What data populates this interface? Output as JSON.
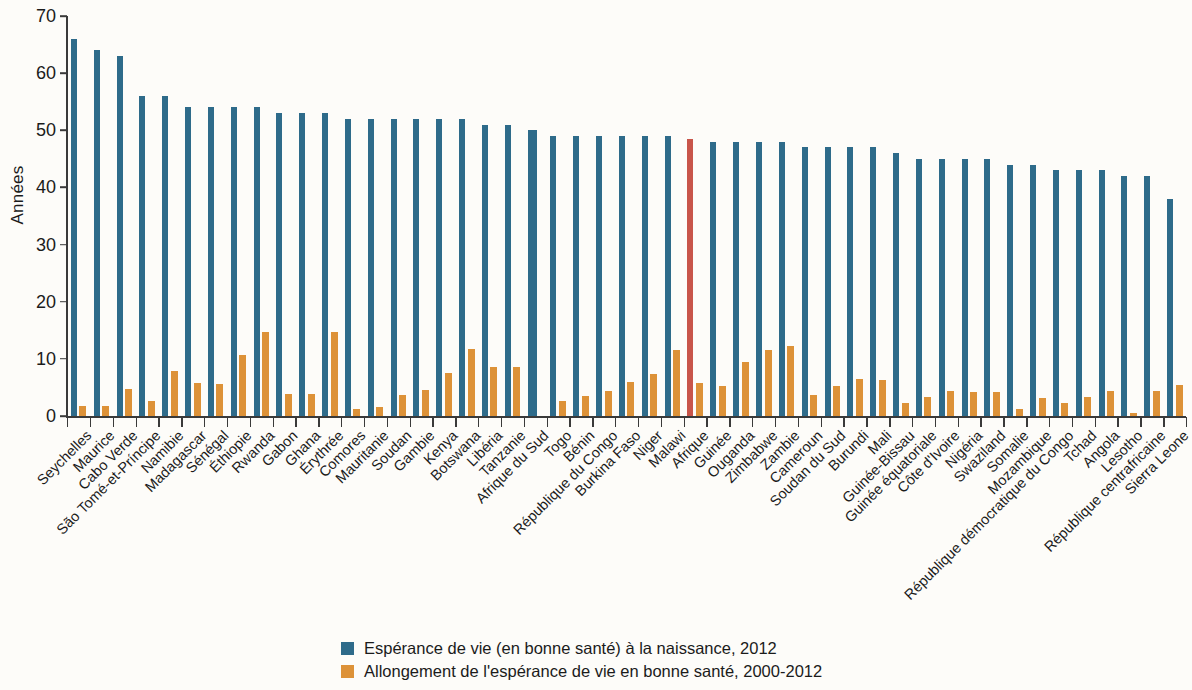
{
  "chart_data": {
    "type": "bar",
    "title": "",
    "subtitle": "",
    "xlabel": "",
    "ylabel": "Années",
    "ylim": [
      0,
      70
    ],
    "ytick_values": [
      0,
      10,
      20,
      30,
      40,
      50,
      60,
      70
    ],
    "ytick_labels": [
      "0",
      "10",
      "20",
      "30",
      "40",
      "50",
      "60",
      "70"
    ],
    "grid": false,
    "legend_position": "bottom-center",
    "highlight_category": "Afrique",
    "highlight_color": "#c8554a",
    "colors": {
      "series_1": "#2e6b8a",
      "series_2": "#dd9238",
      "highlight": "#c8554a",
      "axis": "#3a3a3a",
      "background": "#fdfcf9"
    },
    "categories": [
      "Seychelles",
      "Maurice",
      "Cabo Verde",
      "São Tomé-et-Príncipe",
      "Namibie",
      "Madagascar",
      "Sénégal",
      "Éthiopie",
      "Rwanda",
      "Gabon",
      "Ghana",
      "Érythrée",
      "Comores",
      "Mauritanie",
      "Soudan",
      "Gambie",
      "Kenya",
      "Botswana",
      "Libéria",
      "Tanzanie",
      "Afrique du Sud",
      "Togo",
      "Bénin",
      "République du Congo",
      "Burkina Faso",
      "Niger",
      "Malawi",
      "Afrique",
      "Guinée",
      "Ouganda",
      "Zimbabwe",
      "Zambie",
      "Cameroun",
      "Soudan du Sud",
      "Burundi",
      "Mali",
      "Guinée-Bissau",
      "Guinée équatoriale",
      "Côte d'Ivoire",
      "Nigéria",
      "Swaziland",
      "Somalie",
      "Mozambique",
      "République démocratique du Congo",
      "Tchad",
      "Angola",
      "Lesotho",
      "République centrafricaine",
      "Sierra Leone"
    ],
    "series": [
      {
        "name": "Espérance de vie (en bonne santé) à la naissance, 2012",
        "color": "#2e6b8a",
        "values": [
          66,
          64,
          63,
          56,
          56,
          54,
          54,
          54,
          54,
          53,
          53,
          53,
          52,
          52,
          52,
          52,
          52,
          52,
          51,
          51,
          50,
          49,
          49,
          49,
          49,
          49,
          49,
          48.5,
          48,
          48,
          48,
          48,
          47,
          47,
          47,
          47,
          46,
          45,
          45,
          45,
          45,
          44,
          44,
          43,
          43,
          43,
          42,
          42,
          38
        ]
      },
      {
        "name": "Allongement de l'espérance de vie en bonne santé, 2000-2012",
        "color": "#dd9238",
        "values": [
          1.8,
          1.7,
          4.8,
          2.6,
          7.9,
          5.8,
          5.6,
          10.7,
          14.7,
          3.9,
          3.8,
          14.7,
          1.3,
          1.6,
          3.7,
          4.6,
          7.6,
          11.7,
          8.6,
          8.5,
          0.0,
          2.6,
          3.5,
          4.4,
          6.0,
          7.4,
          11.5,
          5.8,
          5.3,
          9.5,
          11.5,
          12.3,
          3.6,
          5.3,
          6.5,
          6.3,
          2.3,
          3.3,
          4.3,
          4.2,
          4.2,
          1.3,
          3.2,
          2.2,
          3.3,
          4.3,
          0.6,
          4.4,
          5.4
        ]
      }
    ]
  },
  "legend": {
    "items": [
      {
        "swatch_color": "#2e6b8a",
        "label": "Espérance de vie (en bonne santé) à la naissance, 2012"
      },
      {
        "swatch_color": "#dd9238",
        "label": "Allongement de l'espérance de vie en bonne santé, 2000-2012"
      }
    ]
  }
}
